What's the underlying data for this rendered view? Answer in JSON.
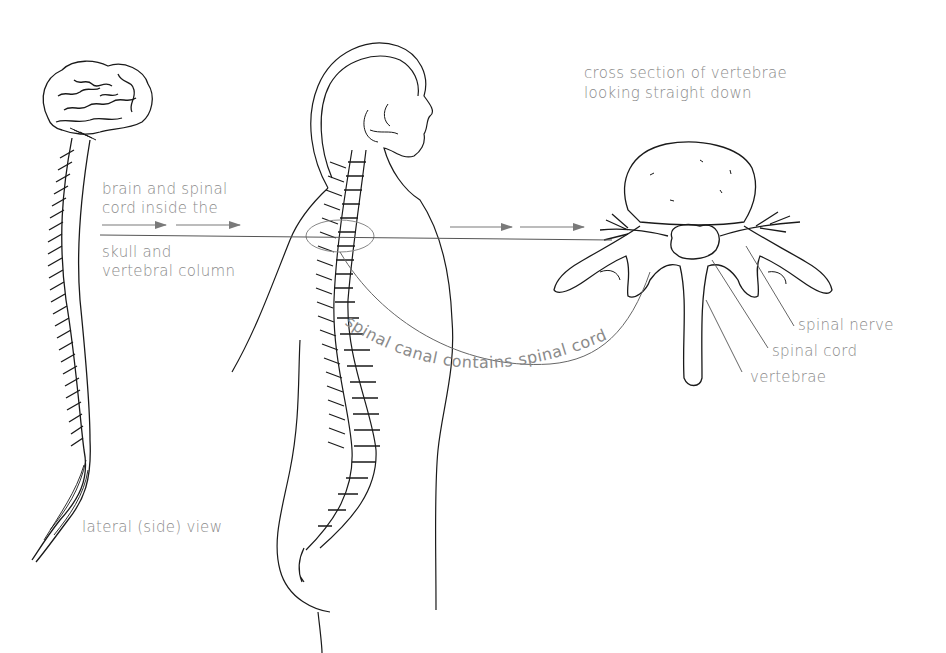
{
  "diagram": {
    "title_cross_section": {
      "line1": "cross section of vertebrae",
      "line2": "looking straight down"
    },
    "left_caption": {
      "line1": "brain and spinal",
      "line2": "cord inside the",
      "line3": "skull and",
      "line4": "vertebral column"
    },
    "arc_label": "spinal canal contains spinal cord",
    "callouts": {
      "spinal_nerve": "spinal nerve",
      "spinal_cord": "spinal cord",
      "vertebrae": "vertebrae"
    },
    "lateral_caption": "lateral (side) view",
    "figures": [
      "brain-and-spinal-cord",
      "human-body-side-view-with-spine",
      "vertebra-cross-section"
    ],
    "colors": {
      "line": "#1a1a1a",
      "label": "#8a8a8a",
      "arrow": "#7a7a7a"
    }
  }
}
